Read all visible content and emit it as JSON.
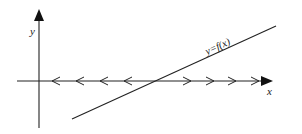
{
  "diagram": {
    "title": "",
    "axes": {
      "x_label": "x",
      "y_label": "y"
    },
    "curve": {
      "label": "y=f(x)",
      "type": "line",
      "start": [
        72,
        119
      ],
      "end": [
        276,
        26
      ]
    },
    "flow_arrows": {
      "left_of_root": {
        "direction": "left",
        "positions_x": [
          52,
          76,
          100,
          124
        ]
      },
      "right_of_root": {
        "direction": "right",
        "positions_x": [
          185,
          208,
          230,
          253
        ]
      }
    },
    "root_crossing_x": 159,
    "colors": {
      "stroke": "#222222",
      "background": "#ffffff"
    }
  }
}
